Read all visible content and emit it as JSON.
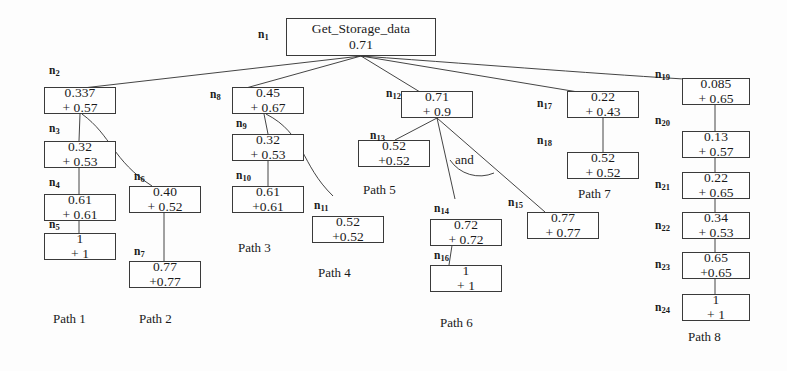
{
  "diagram": {
    "title_node": {
      "id": "n1",
      "label": "n",
      "sub": "1",
      "line1": "Get_Storage_data",
      "line2": "0.71"
    },
    "and_annotation": "and",
    "nodes": [
      {
        "id": "n2",
        "label": "n",
        "sub": "2",
        "line1": "0.337",
        "line2": "+ 0.57"
      },
      {
        "id": "n3",
        "label": "n",
        "sub": "3",
        "line1": "0.32",
        "line2": "+ 0.53"
      },
      {
        "id": "n4",
        "label": "n",
        "sub": "4",
        "line1": "0.61",
        "line2": "+ 0.61"
      },
      {
        "id": "n5",
        "label": "n",
        "sub": "5",
        "line1": "1",
        "line2": "+ 1"
      },
      {
        "id": "n6",
        "label": "n",
        "sub": "6",
        "line1": "0.40",
        "line2": "+ 0.52"
      },
      {
        "id": "n7",
        "label": "n",
        "sub": "7",
        "line1": "0.77",
        "line2": "+0.77"
      },
      {
        "id": "n8",
        "label": "n",
        "sub": "8",
        "line1": "0.45",
        "line2": "+ 0.67"
      },
      {
        "id": "n9",
        "label": "n",
        "sub": "9",
        "line1": "0.32",
        "line2": "+ 0.53"
      },
      {
        "id": "n10",
        "label": "n",
        "sub": "10",
        "line1": "0.61",
        "line2": "+0.61"
      },
      {
        "id": "n11",
        "label": "n",
        "sub": "11",
        "line1": "0.52",
        "line2": "+0.52"
      },
      {
        "id": "n12",
        "label": "n",
        "sub": "12",
        "line1": "0.71",
        "line2": "+ 0.9"
      },
      {
        "id": "n13",
        "label": "n",
        "sub": "13",
        "line1": "0.52",
        "line2": "+0.52"
      },
      {
        "id": "n14",
        "label": "n",
        "sub": "14",
        "line1": "0.72",
        "line2": "+ 0.72"
      },
      {
        "id": "n15",
        "label": "n",
        "sub": "15",
        "line1": "0.77",
        "line2": "+ 0.77"
      },
      {
        "id": "n16",
        "label": "n",
        "sub": "16",
        "line1": "1",
        "line2": "+ 1"
      },
      {
        "id": "n17",
        "label": "n",
        "sub": "17",
        "line1": "0.22",
        "line2": "+ 0.43"
      },
      {
        "id": "n18",
        "label": "n",
        "sub": "18",
        "line1": "0.52",
        "line2": "+ 0.52"
      },
      {
        "id": "n19",
        "label": "n",
        "sub": "19",
        "line1": "0.085",
        "line2": "+ 0.65"
      },
      {
        "id": "n20",
        "label": "n",
        "sub": "20",
        "line1": "0.13",
        "line2": "+ 0.57"
      },
      {
        "id": "n21",
        "label": "n",
        "sub": "21",
        "line1": "0.22",
        "line2": "+ 0.65"
      },
      {
        "id": "n22",
        "label": "n",
        "sub": "22",
        "line1": "0.34",
        "line2": "+ 0.53"
      },
      {
        "id": "n23",
        "label": "n",
        "sub": "23",
        "line1": "0.65",
        "line2": "+0.65"
      },
      {
        "id": "n24",
        "label": "n",
        "sub": "24",
        "line1": "1",
        "line2": "+ 1"
      }
    ],
    "paths": [
      {
        "id": "path1",
        "label": "Path 1"
      },
      {
        "id": "path2",
        "label": "Path 2"
      },
      {
        "id": "path3",
        "label": "Path 3"
      },
      {
        "id": "path4",
        "label": "Path 4"
      },
      {
        "id": "path5",
        "label": "Path 5"
      },
      {
        "id": "path6",
        "label": "Path 6"
      },
      {
        "id": "path7",
        "label": "Path 7"
      },
      {
        "id": "path8",
        "label": "Path 8"
      }
    ]
  }
}
